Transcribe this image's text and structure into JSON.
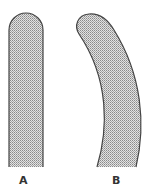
{
  "diagram": {
    "shapes": [
      {
        "id": "A",
        "label": "A",
        "description": "straight rod with rounded top"
      },
      {
        "id": "B",
        "label": "B",
        "description": "curved rod with rounded top"
      }
    ],
    "colors": {
      "fill": "#c8c8c8",
      "outline": "#444444",
      "dot": "#8a8a8a",
      "background": "#ffffff",
      "label": "#333333"
    }
  }
}
